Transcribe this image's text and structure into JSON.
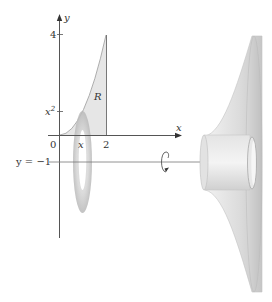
{
  "figure": {
    "axes": {
      "x_axis_label": "x",
      "y_axis_label": "y",
      "origin_label": "0",
      "x_tick_2": "2",
      "x_tick_x": "x",
      "y_tick_4": "4",
      "y_tick_x2_base": "x",
      "y_tick_x2_exp": "2"
    },
    "region_label": "R",
    "rotation_line_label": "y = −1",
    "icons": {
      "rotation": "rotation-arrow-icon"
    },
    "colors": {
      "axis": "#555555",
      "region_fill": "#e6e6e6",
      "solid_light": "#ececec",
      "solid_mid": "#d4d4d4",
      "solid_dark": "#bdbdbd",
      "washer": "#c8c8c8"
    }
  }
}
